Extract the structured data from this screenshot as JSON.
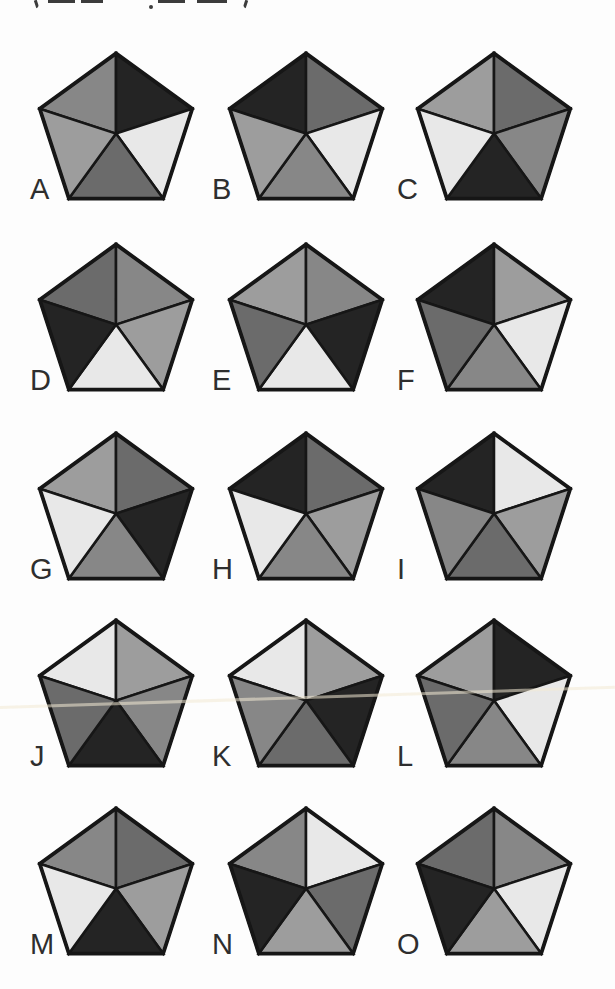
{
  "page": {
    "background": "#fdfdfd",
    "cropped_header": {
      "note_text": "(…)",
      "fragments": [
        {
          "type": "paren-open",
          "x": 35,
          "w": 3
        },
        {
          "type": "bar",
          "x": 48,
          "w": 27
        },
        {
          "type": "bar",
          "x": 81,
          "w": 22
        },
        {
          "type": "dot",
          "x": 149,
          "w": 4
        },
        {
          "type": "bar",
          "x": 158,
          "w": 27
        },
        {
          "type": "bar",
          "x": 197,
          "w": 30
        },
        {
          "type": "paren-close",
          "x": 244,
          "w": 3
        }
      ]
    },
    "scan_artifact_y": 696
  },
  "palette": {
    "black": "#242424",
    "dark": "#6b6b6b",
    "medium": "#878787",
    "mlight": "#9d9d9d",
    "light": "#e8e8e8",
    "outline": "#161616"
  },
  "grid": {
    "rows": 5,
    "cols": 3,
    "col_centers": [
      116,
      306,
      494
    ],
    "row_tops": [
      53,
      244,
      433,
      620,
      808
    ],
    "label_x": [
      30,
      212,
      397
    ],
    "label_offset_y": 122,
    "pentagon_px_width": 166,
    "pentagon_px_height": 152
  },
  "pentagons": [
    {
      "label": "A",
      "row": 0,
      "col": 0,
      "sectors": {
        "top_left": "medium",
        "top_right": "black",
        "right": "light",
        "bottom": "dark",
        "left": "mlight"
      }
    },
    {
      "label": "B",
      "row": 0,
      "col": 1,
      "sectors": {
        "top_left": "black",
        "top_right": "dark",
        "right": "light",
        "bottom": "medium",
        "left": "mlight"
      }
    },
    {
      "label": "C",
      "row": 0,
      "col": 2,
      "sectors": {
        "top_left": "mlight",
        "top_right": "dark",
        "right": "medium",
        "bottom": "black",
        "left": "light"
      }
    },
    {
      "label": "D",
      "row": 1,
      "col": 0,
      "sectors": {
        "top_left": "dark",
        "top_right": "medium",
        "right": "mlight",
        "bottom": "light",
        "left": "black"
      }
    },
    {
      "label": "E",
      "row": 1,
      "col": 1,
      "sectors": {
        "top_left": "mlight",
        "top_right": "medium",
        "right": "black",
        "bottom": "light",
        "left": "dark"
      }
    },
    {
      "label": "F",
      "row": 1,
      "col": 2,
      "sectors": {
        "top_left": "black",
        "top_right": "mlight",
        "right": "light",
        "bottom": "medium",
        "left": "dark"
      }
    },
    {
      "label": "G",
      "row": 2,
      "col": 0,
      "sectors": {
        "top_left": "mlight",
        "top_right": "dark",
        "right": "black",
        "bottom": "medium",
        "left": "light"
      }
    },
    {
      "label": "H",
      "row": 2,
      "col": 1,
      "sectors": {
        "top_left": "black",
        "top_right": "dark",
        "right": "mlight",
        "bottom": "medium",
        "left": "light"
      }
    },
    {
      "label": "I",
      "row": 2,
      "col": 2,
      "sectors": {
        "top_left": "black",
        "top_right": "light",
        "right": "mlight",
        "bottom": "dark",
        "left": "medium"
      }
    },
    {
      "label": "J",
      "row": 3,
      "col": 0,
      "sectors": {
        "top_left": "light",
        "top_right": "mlight",
        "right": "medium",
        "bottom": "black",
        "left": "dark"
      }
    },
    {
      "label": "K",
      "row": 3,
      "col": 1,
      "sectors": {
        "top_left": "light",
        "top_right": "mlight",
        "right": "black",
        "bottom": "dark",
        "left": "medium"
      }
    },
    {
      "label": "L",
      "row": 3,
      "col": 2,
      "sectors": {
        "top_left": "mlight",
        "top_right": "black",
        "right": "light",
        "bottom": "medium",
        "left": "dark"
      }
    },
    {
      "label": "M",
      "row": 4,
      "col": 0,
      "sectors": {
        "top_left": "medium",
        "top_right": "dark",
        "right": "mlight",
        "bottom": "black",
        "left": "light"
      }
    },
    {
      "label": "N",
      "row": 4,
      "col": 1,
      "sectors": {
        "top_left": "medium",
        "top_right": "light",
        "right": "dark",
        "bottom": "mlight",
        "left": "black"
      }
    },
    {
      "label": "O",
      "row": 4,
      "col": 2,
      "sectors": {
        "top_left": "dark",
        "top_right": "medium",
        "right": "light",
        "bottom": "mlight",
        "left": "black"
      }
    }
  ]
}
